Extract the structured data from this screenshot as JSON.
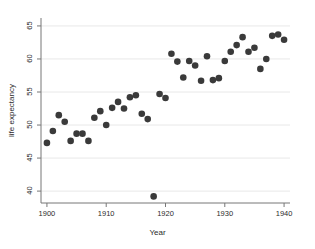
{
  "chart_data": {
    "type": "scatter",
    "title": "",
    "subtitle": "",
    "xlabel": "Year",
    "ylabel": "life expectancy",
    "xlim": [
      1899,
      1941
    ],
    "ylim": [
      38.2,
      66.2
    ],
    "xticks": [
      1900,
      1910,
      1920,
      1930,
      1940
    ],
    "yticks": [
      40,
      45,
      50,
      55,
      60,
      65
    ],
    "xtick_labels": [
      "1900",
      "1910",
      "1920",
      "1930",
      "1940"
    ],
    "ytick_labels": [
      "40",
      "45",
      "50",
      "55",
      "60",
      "65"
    ],
    "grid": "horizontal",
    "legend": "none",
    "marker": {
      "shape": "circle",
      "color": "#3a3a3a",
      "size_px": 3.3
    },
    "series": [
      {
        "name": "life expectancy",
        "points": [
          [
            1900,
            47.3
          ],
          [
            1901,
            49.1
          ],
          [
            1902,
            51.5
          ],
          [
            1903,
            50.5
          ],
          [
            1904,
            47.6
          ],
          [
            1905,
            48.7
          ],
          [
            1906,
            48.7
          ],
          [
            1907,
            47.6
          ],
          [
            1908,
            51.1
          ],
          [
            1910,
            50.0
          ],
          [
            1909,
            52.1
          ],
          [
            1911,
            52.6
          ],
          [
            1912,
            53.5
          ],
          [
            1913,
            52.5
          ],
          [
            1914,
            54.2
          ],
          [
            1915,
            54.5
          ],
          [
            1916,
            51.7
          ],
          [
            1917,
            50.9
          ],
          [
            1918,
            39.2
          ],
          [
            1919,
            54.7
          ],
          [
            1920,
            54.1
          ],
          [
            1921,
            60.8
          ],
          [
            1922,
            59.6
          ],
          [
            1923,
            57.2
          ],
          [
            1924,
            59.7
          ],
          [
            1925,
            59.0
          ],
          [
            1926,
            56.7
          ],
          [
            1927,
            60.4
          ],
          [
            1928,
            56.8
          ],
          [
            1929,
            57.1
          ],
          [
            1930,
            59.7
          ],
          [
            1931,
            61.1
          ],
          [
            1932,
            62.1
          ],
          [
            1933,
            63.3
          ],
          [
            1934,
            61.1
          ],
          [
            1935,
            61.7
          ],
          [
            1936,
            58.5
          ],
          [
            1937,
            60.0
          ],
          [
            1938,
            63.5
          ],
          [
            1939,
            63.7
          ],
          [
            1940,
            62.9
          ]
        ]
      }
    ]
  },
  "axes": {
    "x_title": "Year",
    "y_title": "life expectancy"
  },
  "colors": {
    "marker": "#3a3a3a",
    "gridline": "#e8e8e8",
    "axis": "#777777",
    "text": "#2b2b2b",
    "background": "#ffffff"
  }
}
